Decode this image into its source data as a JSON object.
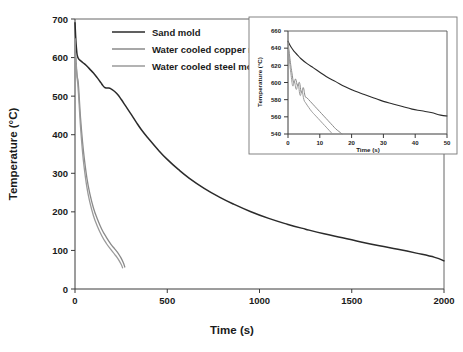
{
  "chart_data": {
    "type": "line",
    "title": "",
    "xlabel": "Time (s)",
    "ylabel": "Temperature (°C)",
    "xlim": [
      0,
      2000
    ],
    "ylim": [
      0,
      700
    ],
    "xticks": [
      0,
      500,
      1000,
      1500,
      2000
    ],
    "yticks": [
      0,
      100,
      200,
      300,
      400,
      500,
      600,
      700
    ],
    "grid": false,
    "legend_position": "top-center",
    "series": [
      {
        "name": "Sand mold",
        "color": "#2b2b2b",
        "width": 1.5,
        "x": [
          0,
          3,
          6,
          9,
          12,
          18,
          25,
          35,
          45,
          60,
          80,
          100,
          120,
          140,
          150,
          160,
          170,
          180,
          195,
          210,
          230,
          250,
          275,
          300,
          330,
          360,
          400,
          450,
          500,
          560,
          620,
          700,
          780,
          860,
          950,
          1050,
          1150,
          1250,
          1350,
          1450,
          1550,
          1650,
          1750,
          1850,
          1950,
          2000
        ],
        "y": [
          690,
          660,
          635,
          618,
          606,
          598,
          594,
          590,
          586,
          580,
          570,
          560,
          548,
          535,
          528,
          523,
          521,
          521,
          519,
          514,
          505,
          492,
          474,
          456,
          434,
          413,
          389,
          361,
          336,
          310,
          287,
          261,
          239,
          220,
          201,
          183,
          168,
          155,
          143,
          133,
          122,
          112,
          103,
          93,
          82,
          73
        ]
      },
      {
        "name": "Water cooled copper mold",
        "color": "#8a8a8a",
        "width": 1.3,
        "x": [
          0,
          1,
          2,
          3,
          4,
          5,
          6,
          7,
          8,
          9,
          10,
          12,
          14,
          17,
          20,
          25,
          30,
          40,
          50,
          65,
          80,
          100,
          120,
          145,
          170,
          195,
          215,
          235,
          250,
          262,
          270
        ],
        "y": [
          650,
          612,
          600,
          610,
          588,
          600,
          578,
          586,
          572,
          568,
          562,
          552,
          546,
          538,
          520,
          480,
          444,
          386,
          340,
          286,
          248,
          210,
          183,
          155,
          134,
          116,
          104,
          92,
          80,
          68,
          57
        ]
      },
      {
        "name": "Water cooled steel mold",
        "color": "#9a9a9a",
        "width": 1.3,
        "x": [
          0,
          1,
          2,
          3,
          4,
          5,
          6,
          7,
          8,
          9,
          10,
          11,
          13,
          15,
          17,
          20,
          25,
          30,
          40,
          50,
          65,
          80,
          100,
          120,
          145,
          170,
          195,
          215,
          235,
          250,
          258
        ],
        "y": [
          648,
          606,
          594,
          606,
          582,
          596,
          574,
          582,
          568,
          562,
          554,
          548,
          540,
          532,
          518,
          498,
          458,
          420,
          360,
          314,
          262,
          226,
          190,
          164,
          138,
          118,
          102,
          90,
          77,
          64,
          55
        ]
      }
    ],
    "legend": [
      {
        "label": "Sand mold",
        "color": "#2b2b2b"
      },
      {
        "label": "Water cooled copper mold",
        "color": "#8a8a8a"
      },
      {
        "label": "Water cooled steel mold",
        "color": "#9a9a9a"
      }
    ],
    "inset": {
      "xlabel": "Time (s)",
      "ylabel": "Temperature (°C)",
      "xlim": [
        0,
        50
      ],
      "ylim": [
        540,
        660
      ],
      "xticks": [
        0,
        10,
        20,
        30,
        40,
        50
      ],
      "yticks": [
        540,
        560,
        580,
        600,
        620,
        640,
        660
      ],
      "grid": false,
      "series": [
        {
          "name": "Sand mold",
          "color": "#2b2b2b",
          "width": 1.1,
          "x": [
            0,
            1,
            2,
            3,
            4,
            6,
            8,
            10,
            12,
            15,
            18,
            21,
            24,
            27,
            30,
            33,
            36,
            39,
            42,
            45,
            48,
            50
          ],
          "y": [
            648,
            641,
            636,
            632,
            628,
            622,
            617,
            612,
            607,
            601,
            595,
            590,
            586,
            582,
            578,
            575,
            572,
            569,
            567,
            565,
            562,
            561
          ]
        },
        {
          "name": "Water cooled copper mold",
          "color": "#8a8a8a",
          "width": 1.0,
          "x": [
            0,
            0.6,
            1.2,
            1.8,
            2.4,
            3.0,
            3.6,
            4.2,
            4.8,
            5.4,
            6,
            7,
            8,
            9,
            10,
            11,
            12,
            13,
            14,
            15,
            16,
            17
          ],
          "y": [
            648,
            628,
            612,
            600,
            604,
            596,
            600,
            588,
            594,
            584,
            582,
            578,
            574,
            570,
            566,
            562,
            558,
            554,
            550,
            546,
            543,
            540
          ]
        },
        {
          "name": "Water cooled steel mold",
          "color": "#9a9a9a",
          "width": 1.0,
          "x": [
            0,
            0.5,
            1.0,
            1.5,
            2.0,
            2.6,
            3.2,
            3.8,
            4.4,
            5.0,
            5.6,
            6.5,
            7.5,
            8.5,
            9.5,
            10.5,
            11.5,
            12.5,
            13.5,
            14
          ],
          "y": [
            646,
            624,
            608,
            596,
            601,
            592,
            598,
            585,
            590,
            580,
            576,
            571,
            566,
            562,
            558,
            554,
            550,
            546,
            542,
            540
          ]
        }
      ]
    }
  }
}
